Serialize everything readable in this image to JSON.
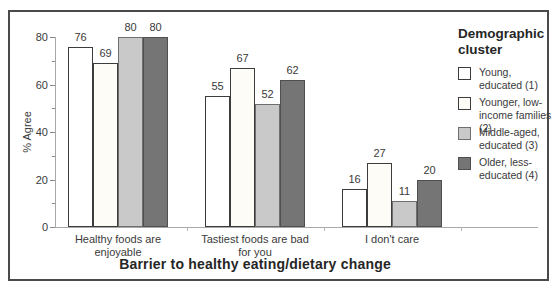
{
  "figure": {
    "background": "#ffffff",
    "frame_color": "#4a4a4a",
    "axis_color": "#a8a8a8",
    "text_color": "#3a3a3a"
  },
  "chart_data": {
    "type": "bar",
    "title": "",
    "xlabel": "Barrier to healthy eating/dietary change",
    "ylabel": "% Agree",
    "ylim": [
      0,
      80
    ],
    "yticks": [
      0,
      20,
      40,
      60,
      80
    ],
    "yticks_minor": [
      10,
      30,
      50,
      70
    ],
    "grid": false,
    "bar_value_labels": true,
    "legend_position": "right",
    "legend_title": "Demographic\ncluster",
    "categories": [
      "Healthy foods are\nenjoyable",
      "Tastiest foods are bad\nfor you",
      "I don't care"
    ],
    "series": [
      {
        "name": "Young, educated (1)",
        "legend_lines": "Young,\neducated (1)",
        "color": "#ffffff",
        "border": "#3c3c3c",
        "values": [
          76,
          55,
          16
        ]
      },
      {
        "name": "Younger, low-income families (2)",
        "legend_lines": "Younger, low-\nincome families (2)",
        "color": "#fdfcf6",
        "border": "#3c3c3c",
        "values": [
          69,
          67,
          27
        ]
      },
      {
        "name": "Middle-aged, educated (3)",
        "legend_lines": "Middle-aged,\neducated (3)",
        "color": "#c9c9c9",
        "border": "#6e6e6e",
        "values": [
          80,
          52,
          11
        ]
      },
      {
        "name": "Older, less-educated (4)",
        "legend_lines": "Older, less-\neducated (4)",
        "color": "#757575",
        "border": "#4f4f4f",
        "values": [
          80,
          62,
          20
        ]
      }
    ]
  }
}
